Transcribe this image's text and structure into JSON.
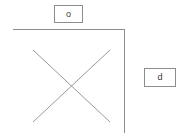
{
  "diagram": {
    "background_color": "#ffffff",
    "stroke_color": "#8d8d8d",
    "frame": {
      "name": "l-shaped-frame",
      "top_line": {
        "x1": 13,
        "y1": 29,
        "x2": 124,
        "y2": 29
      },
      "right_line": {
        "x1": 124,
        "y1": 29,
        "x2": 124,
        "y2": 133
      }
    },
    "cross": {
      "name": "x-cross-mark",
      "line_a": {
        "x1": 33,
        "y1": 50,
        "x2": 110,
        "y2": 122
      },
      "line_b": {
        "x1": 110,
        "y1": 50,
        "x2": 33,
        "y2": 122
      },
      "center": {
        "x": 72,
        "y": 86
      }
    },
    "labels": [
      {
        "id": "top",
        "text": "o",
        "box": {
          "x": 54,
          "y": 5,
          "width": 29,
          "height": 18
        }
      },
      {
        "id": "right",
        "text": "d",
        "box": {
          "x": 144,
          "y": 68,
          "width": 32,
          "height": 19
        }
      }
    ]
  }
}
